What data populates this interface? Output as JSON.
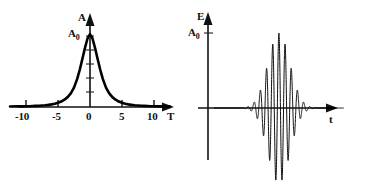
{
  "figure": {
    "title": "",
    "background_color": "#ffffff",
    "stroke_color": "#000000",
    "width": 372,
    "height": 184
  },
  "panels": {
    "amplitude": {
      "name": "amplitude-spectrum-panel",
      "y_axis_label": "A",
      "y_peak_label": "A",
      "y_peak_sub": "0",
      "x_axis_label": "T",
      "x_ticks": [
        "-10",
        "-5",
        "0",
        "5",
        "10"
      ]
    },
    "field": {
      "name": "electric-field-panel",
      "y_axis_label": "E",
      "y_peak_label": "A",
      "y_peak_sub": "0",
      "x_axis_label": "t",
      "x_ticks": []
    }
  },
  "chart_data": [
    {
      "type": "line",
      "id": "amplitude-spectrum",
      "title": "",
      "xlabel": "T",
      "ylabel": "A",
      "xlim": [
        -12.5,
        12.5
      ],
      "ylim": [
        0,
        1.12
      ],
      "xticks": [
        -10,
        -5,
        0,
        5,
        10
      ],
      "xticklabels": [
        "-10",
        "-5",
        "0",
        "5",
        "10"
      ],
      "yticks": [
        0.2,
        0.4,
        0.6,
        0.8,
        1.0
      ],
      "yticklabels": [],
      "grid": false,
      "legend": null,
      "annotations": [
        {
          "text": "A_0",
          "x": 0,
          "y": 1.0,
          "note": "peak amplitude marker on y-axis"
        }
      ],
      "description": "Bell-shaped (Lorentzian/Gaussian) amplitude spectrum peaking at T = 0 with value A_0",
      "x": [
        -12.5,
        -11.5,
        -10.5,
        -10,
        -9.5,
        -9,
        -8.5,
        -8,
        -7.5,
        -7,
        -6.5,
        -6,
        -5.5,
        -5,
        -4.5,
        -4,
        -3.5,
        -3,
        -2.5,
        -2,
        -1.6,
        -1.2,
        -0.8,
        -0.4,
        0,
        0.4,
        0.8,
        1.2,
        1.6,
        2,
        2.5,
        3,
        3.5,
        4,
        4.5,
        5,
        5.5,
        6,
        6.5,
        7,
        7.5,
        8,
        8.5,
        9,
        9.5,
        10,
        10.5,
        11.5,
        12.5
      ],
      "y": [
        0.006,
        0.008,
        0.009,
        0.01,
        0.011,
        0.013,
        0.015,
        0.017,
        0.02,
        0.024,
        0.029,
        0.036,
        0.045,
        0.058,
        0.075,
        0.1,
        0.135,
        0.187,
        0.265,
        0.385,
        0.51,
        0.655,
        0.805,
        0.935,
        1.0,
        0.935,
        0.805,
        0.655,
        0.51,
        0.385,
        0.265,
        0.187,
        0.135,
        0.1,
        0.075,
        0.058,
        0.045,
        0.036,
        0.029,
        0.024,
        0.02,
        0.017,
        0.015,
        0.013,
        0.011,
        0.01,
        0.009,
        0.008,
        0.006
      ]
    },
    {
      "type": "line",
      "id": "electric-field-wave-packet",
      "title": "",
      "xlabel": "t",
      "ylabel": "E",
      "xlim": [
        -6.5,
        6.5
      ],
      "ylim": [
        -1.15,
        1.15
      ],
      "xticks": [],
      "xticklabels": [],
      "yticks": [
        1.0
      ],
      "yticklabels": [
        "A_0"
      ],
      "grid": false,
      "legend": null,
      "annotations": [
        {
          "text": "A_0",
          "x": -6.0,
          "y": 1.0,
          "note": "envelope maximum tick on y-axis"
        }
      ],
      "description": "Gaussian-enveloped oscillating electric field wave packet centred at t = 0; envelope exp(-(t/1.55)^2), carrier cos(2*pi*t/0.62)",
      "envelope": {
        "form": "gaussian",
        "sigma": 1.55,
        "amplitude": 1.0,
        "center": 0
      },
      "carrier": {
        "form": "cosine",
        "period": 0.62,
        "phase": 0
      }
    }
  ]
}
